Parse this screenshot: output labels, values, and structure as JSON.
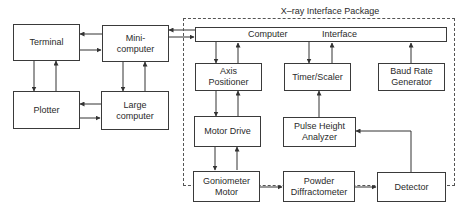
{
  "diagram": {
    "package_label": "X–ray Interface Package",
    "interface": {
      "left_label": "Computer",
      "right_label": "Interface"
    },
    "blocks": {
      "terminal": "Terminal",
      "minicomputer": [
        "Mini-",
        "computer"
      ],
      "plotter": "Plotter",
      "large_computer": [
        "Large",
        "computer"
      ],
      "axis_positioner": [
        "Axis",
        "Positioner"
      ],
      "timer_scaler": "Timer/Scaler",
      "baud_rate_generator": [
        "Baud Rate",
        "Generator"
      ],
      "motor_drive": "Motor Drive",
      "pulse_height_analyzer": [
        "Pulse Height",
        "Analyzer"
      ],
      "goniometer_motor": [
        "Goniometer",
        "Motor"
      ],
      "powder_diffractometer": [
        "Powder",
        "Diffractometer"
      ],
      "detector": "Detector"
    },
    "connections": [
      {
        "from": "minicomputer",
        "to": "terminal"
      },
      {
        "from": "terminal",
        "to": "minicomputer"
      },
      {
        "from": "terminal",
        "to": "plotter"
      },
      {
        "from": "plotter",
        "to": "terminal"
      },
      {
        "from": "minicomputer",
        "to": "large_computer"
      },
      {
        "from": "large_computer",
        "to": "minicomputer"
      },
      {
        "from": "large_computer",
        "to": "plotter"
      },
      {
        "from": "plotter",
        "to": "large_computer"
      },
      {
        "from": "computer_interface",
        "to": "minicomputer"
      },
      {
        "from": "minicomputer",
        "to": "computer_interface"
      },
      {
        "from": "computer_interface",
        "to": "axis_positioner"
      },
      {
        "from": "axis_positioner",
        "to": "computer_interface"
      },
      {
        "from": "computer_interface",
        "to": "timer_scaler"
      },
      {
        "from": "timer_scaler",
        "to": "computer_interface"
      },
      {
        "from": "baud_rate_generator",
        "to": "computer_interface"
      },
      {
        "from": "axis_positioner",
        "to": "motor_drive"
      },
      {
        "from": "motor_drive",
        "to": "axis_positioner"
      },
      {
        "from": "pulse_height_analyzer",
        "to": "timer_scaler"
      },
      {
        "from": "motor_drive",
        "to": "goniometer_motor"
      },
      {
        "from": "goniometer_motor",
        "to": "motor_drive"
      },
      {
        "from": "goniometer_motor",
        "to": "powder_diffractometer"
      },
      {
        "from": "powder_diffractometer",
        "to": "detector"
      },
      {
        "from": "detector",
        "to": "pulse_height_analyzer"
      }
    ]
  }
}
